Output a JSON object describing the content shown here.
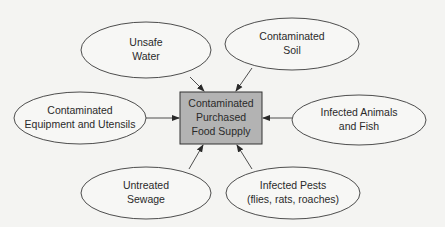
{
  "diagram": {
    "center": {
      "lines": [
        "Contaminated",
        "Purchased",
        "Food Supply"
      ],
      "fill": "#b3b3b3"
    },
    "sources": [
      {
        "id": "unsafe-water",
        "lines": [
          "Unsafe",
          "Water"
        ]
      },
      {
        "id": "contaminated-soil",
        "lines": [
          "Contaminated",
          "Soil"
        ]
      },
      {
        "id": "equipment-utensils",
        "lines": [
          "Contaminated",
          "Equipment and Utensils"
        ]
      },
      {
        "id": "infected-animals-fish",
        "lines": [
          "Infected Animals",
          "and Fish"
        ]
      },
      {
        "id": "untreated-sewage",
        "lines": [
          "Untreated",
          "Sewage"
        ]
      },
      {
        "id": "infected-pests",
        "lines": [
          "Infected Pests",
          "(flies, rats, roaches)"
        ]
      }
    ],
    "colors": {
      "background": "#f4f4f2",
      "stroke": "#3a3a3a",
      "center_fill": "#b3b3b3"
    }
  }
}
